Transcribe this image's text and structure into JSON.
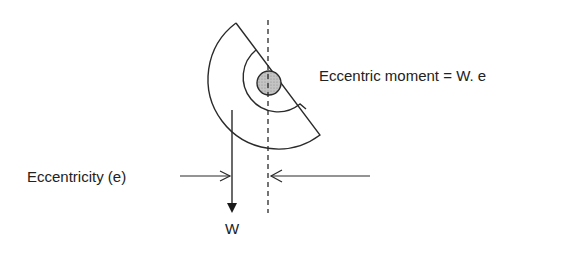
{
  "labels": {
    "moment": "Eccentric moment = W. e",
    "eccentricity": "Eccentricity (e)",
    "weight": "W"
  },
  "colors": {
    "stroke": "#2a2a2a",
    "shaft_fill": "#b8b8b8",
    "background": "#ffffff"
  }
}
